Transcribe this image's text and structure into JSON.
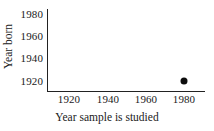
{
  "chart_data": {
    "type": "scatter",
    "title": "",
    "xlabel": "Year sample is studied",
    "ylabel": "Year born",
    "xlim": [
      1910,
      1990
    ],
    "ylim": [
      1912,
      1988
    ],
    "xticks": [
      1920,
      1940,
      1960,
      1980
    ],
    "yticks": [
      1920,
      1940,
      1960,
      1980
    ],
    "xticklabels": [
      "1920",
      "1940",
      "1960",
      "1980"
    ],
    "yticklabels": [
      "1920",
      "1940",
      "1960",
      "1980"
    ],
    "grid": false,
    "legend": false,
    "legend_position": "none",
    "marker": "filled-circle",
    "marker_color": "#0d0d0d",
    "background_color": "#ffffff",
    "axis_color": "#222222",
    "points": [
      {
        "x": 1980,
        "y": 1920,
        "label": ""
      }
    ],
    "series": [
      {
        "name": "sample",
        "x": [
          1980
        ],
        "y": [
          1920
        ]
      }
    ]
  },
  "axes": {
    "y_tick_0": "1980",
    "y_tick_1": "1960",
    "y_tick_2": "1940",
    "y_tick_3": "1920",
    "x_tick_0": "1920",
    "x_tick_1": "1940",
    "x_tick_2": "1960",
    "x_tick_3": "1980",
    "x_title": "Year sample is studied",
    "y_title": "Year born"
  }
}
